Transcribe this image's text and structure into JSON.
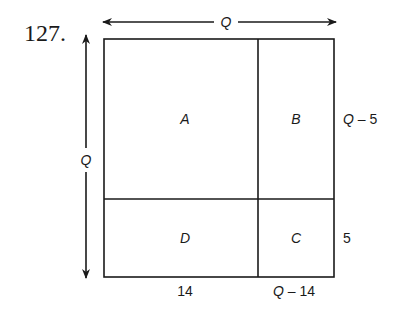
{
  "problem_number": "127.",
  "diagram": {
    "top_dimension_label": "Q",
    "left_dimension_label": "Q",
    "regions": {
      "top_left": "A",
      "top_right": "B",
      "bottom_left": "D",
      "bottom_right": "C"
    },
    "right_labels": {
      "upper": "Q – 5",
      "lower": "5"
    },
    "bottom_labels": {
      "left": "14",
      "right": "Q – 14"
    }
  }
}
